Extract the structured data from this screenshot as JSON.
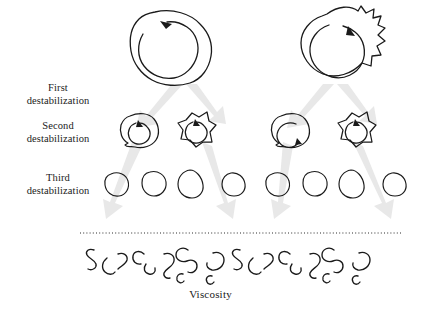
{
  "figure": {
    "type": "diagram",
    "background_color": "#ffffff",
    "ink_color": "#1a1a1a",
    "arrow_color": "#e6e6e6"
  },
  "stage_labels": [
    {
      "line1": "First",
      "line2": "destabilization"
    },
    {
      "line1": "Second",
      "line2": "destabilization"
    },
    {
      "line1": "Third",
      "line2": "destabilization"
    }
  ],
  "axis_label": "Viscosity",
  "levels": {
    "level1": {
      "name": "large-aggregates",
      "count": 2,
      "has_internal_rotation_arrow": true
    },
    "level2": {
      "name": "medium-aggregates",
      "count": 4,
      "has_internal_rotation_arrow": true
    },
    "level3": {
      "name": "small-droplets",
      "count": 8,
      "has_internal_rotation_arrow": false
    },
    "level4": {
      "name": "polymer-squiggles",
      "count": 14,
      "has_internal_rotation_arrow": false
    }
  },
  "divider": {
    "name": "dotted-separator",
    "style": "dotted",
    "x_start": 80,
    "x_end": 402,
    "y": 233
  },
  "branch_arrows": {
    "name": "splitting-arrows",
    "count": 8,
    "color": "#e6e6e6",
    "description": "thick pale grey tapered arrows branching downward in V shapes"
  }
}
